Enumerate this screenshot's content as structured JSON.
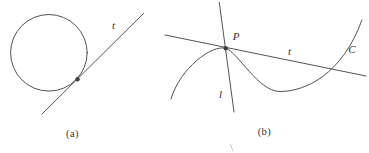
{
  "colors": {
    "background": "#ffffff",
    "stroke": "#3f3f3f",
    "text": "#333333"
  },
  "panel_a": {
    "caption": "(a)",
    "tangent_label": "t"
  },
  "panel_b": {
    "caption": "(b)",
    "point_label": "P",
    "tangent_label": "t",
    "line_label": "l",
    "curve_label": "C"
  }
}
